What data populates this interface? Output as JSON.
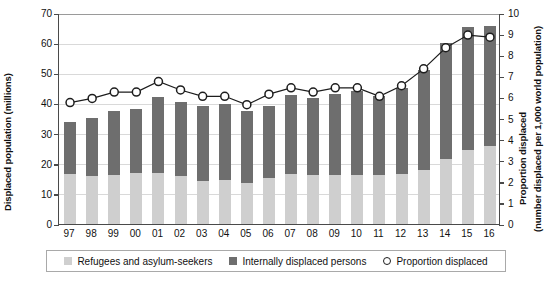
{
  "chart_data": {
    "type": "bar",
    "title": "",
    "subtitle": "",
    "xlabel": "",
    "ylabel": "Displaced population (millions)",
    "y2label_line1": "Proportion displaced",
    "y2label_line2": "(number displaced per 1,000 world population)",
    "categories": [
      "97",
      "98",
      "99",
      "00",
      "01",
      "02",
      "03",
      "04",
      "05",
      "06",
      "07",
      "08",
      "09",
      "10",
      "11",
      "12",
      "13",
      "14",
      "15",
      "16"
    ],
    "ylim": [
      0,
      70
    ],
    "y2lim": [
      0,
      10
    ],
    "yticks": [
      "0",
      "10",
      "20",
      "30",
      "40",
      "50",
      "60",
      "70"
    ],
    "ytick_values": [
      0,
      10,
      20,
      30,
      40,
      50,
      60,
      70
    ],
    "y2ticks": [
      "0",
      "1",
      "2",
      "3",
      "4",
      "5",
      "6",
      "7",
      "8",
      "9",
      "10"
    ],
    "y2tick_values": [
      0,
      1,
      2,
      3,
      4,
      5,
      6,
      7,
      8,
      9,
      10
    ],
    "grid": true,
    "stacked": true,
    "legend_position": "bottom",
    "series": [
      {
        "name": "Refugees and asylum-seekers",
        "type": "bar",
        "axis": "left",
        "color": "#cfcfcf",
        "values": [
          16.5,
          15.8,
          16.2,
          16.8,
          17.0,
          15.8,
          14.4,
          14.6,
          13.7,
          15.2,
          16.5,
          16.1,
          16.3,
          16.4,
          16.3,
          16.5,
          18.0,
          21.6,
          24.7,
          25.8
        ]
      },
      {
        "name": "Internally displaced persons",
        "type": "bar",
        "axis": "left",
        "color": "#6e6e6e",
        "values": [
          17.2,
          19.4,
          21.2,
          21.5,
          25.0,
          24.8,
          24.9,
          25.2,
          23.7,
          24.0,
          26.3,
          25.8,
          27.0,
          27.7,
          26.2,
          28.6,
          33.2,
          38.3,
          40.6,
          39.8
        ]
      },
      {
        "name": "Proportion displaced",
        "type": "line",
        "axis": "right",
        "color": "#1d1d1d",
        "marker": "circle-open",
        "values": [
          5.8,
          6.0,
          6.3,
          6.3,
          6.8,
          6.4,
          6.1,
          6.1,
          5.7,
          6.2,
          6.5,
          6.3,
          6.5,
          6.5,
          6.1,
          6.6,
          7.4,
          8.4,
          9.0,
          8.9
        ]
      }
    ],
    "totals": [
      33.7,
      35.2,
      37.4,
      38.3,
      42.0,
      40.6,
      39.3,
      39.8,
      37.4,
      39.2,
      42.8,
      41.9,
      43.3,
      44.1,
      42.5,
      45.1,
      51.2,
      59.9,
      65.3,
      65.6
    ]
  },
  "legend": {
    "items": [
      {
        "label": "Refugees and asylum-seekers",
        "marker": "square-light"
      },
      {
        "label": "Internally displaced persons",
        "marker": "square-dark"
      },
      {
        "label": "Proportion displaced",
        "marker": "circle-open"
      }
    ]
  },
  "colors": {
    "refugees": "#cfcfcf",
    "idp": "#6e6e6e",
    "line": "#1d1d1d",
    "axis": "#4a4a4a",
    "grid": "#d9d9d9",
    "background": "#ffffff"
  }
}
